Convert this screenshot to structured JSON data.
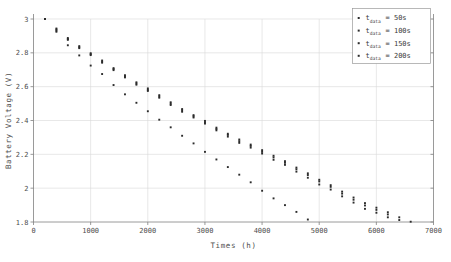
{
  "chart_data": {
    "type": "scatter",
    "title": "",
    "xlabel": "Times (h)",
    "ylabel": "Battery Voltage (V)",
    "xlim": [
      0,
      7000
    ],
    "ylim": [
      1.8,
      3.0
    ],
    "xticks": [
      0,
      1000,
      2000,
      3000,
      4000,
      5000,
      6000,
      7000
    ],
    "xticklabels": [
      "0",
      "1000",
      "2000",
      "3000",
      "4000",
      "5000",
      "6000",
      "7000"
    ],
    "yticks": [
      1.8,
      2.0,
      2.2,
      2.4,
      2.6,
      2.8,
      3.0
    ],
    "yticklabels": [
      "1.8",
      "2",
      "2.2",
      "2.4",
      "2.6",
      "2.8",
      "3"
    ],
    "grid": true,
    "legend_position": "top-right",
    "marker": "dot",
    "marker_color": "#2b2b2b",
    "series": [
      {
        "name": "t_data= 50s",
        "label_base": "t",
        "label_sub": "data",
        "label_value": "= 50s",
        "x": [
          200,
          400,
          600,
          800,
          1000,
          1200,
          1400,
          1600,
          1800,
          2000,
          2200,
          2400,
          2600,
          2800,
          3000,
          3200,
          3400,
          3600,
          3800,
          4000,
          4200,
          4400,
          4600,
          4800
        ],
        "y": [
          3.0,
          2.925,
          2.845,
          2.785,
          2.725,
          2.675,
          2.61,
          2.555,
          2.505,
          2.455,
          2.405,
          2.36,
          2.31,
          2.265,
          2.215,
          2.17,
          2.125,
          2.08,
          2.035,
          1.985,
          1.94,
          1.9,
          1.86,
          1.815
        ]
      },
      {
        "name": "t_data= 100s",
        "label_base": "t",
        "label_sub": "data",
        "label_value": "= 100s",
        "x": [
          200,
          400,
          600,
          800,
          1000,
          1200,
          1400,
          1600,
          1800,
          2000,
          2200,
          2400,
          2600,
          2800,
          3000,
          3200,
          3400,
          3600,
          3800,
          4000,
          4200,
          4400,
          4600,
          4800,
          5000,
          5200,
          5400,
          5600,
          5800,
          6000,
          6200,
          6400,
          6600
        ],
        "y": [
          3.0,
          2.932,
          2.877,
          2.828,
          2.787,
          2.742,
          2.698,
          2.655,
          2.612,
          2.575,
          2.535,
          2.492,
          2.452,
          2.418,
          2.382,
          2.342,
          2.305,
          2.268,
          2.24,
          2.205,
          2.168,
          2.138,
          2.098,
          2.062,
          2.022,
          1.992,
          1.952,
          1.915,
          1.878,
          1.855,
          1.828,
          1.812,
          1.802
        ]
      },
      {
        "name": "t_data= 150s",
        "label_base": "t",
        "label_sub": "data",
        "label_value": "= 150s",
        "x": [
          200,
          400,
          600,
          800,
          1000,
          1200,
          1400,
          1600,
          1800,
          2000,
          2200,
          2400,
          2600,
          2800,
          3000,
          3200,
          3400,
          3600,
          3800,
          4000,
          4200,
          4400,
          4600,
          4800,
          5000,
          5200,
          5400,
          5600,
          5800,
          6000,
          6200,
          6400
        ],
        "y": [
          3.0,
          2.938,
          2.882,
          2.833,
          2.792,
          2.748,
          2.704,
          2.661,
          2.619,
          2.582,
          2.542,
          2.5,
          2.46,
          2.425,
          2.39,
          2.35,
          2.315,
          2.278,
          2.25,
          2.215,
          2.182,
          2.15,
          2.112,
          2.078,
          2.04,
          2.008,
          1.968,
          1.932,
          1.898,
          1.872,
          1.845,
          1.828
        ]
      },
      {
        "name": "t_data= 200s",
        "label_base": "t",
        "label_sub": "data",
        "label_value": "= 200s",
        "x": [
          200,
          400,
          600,
          800,
          1000,
          1200,
          1400,
          1600,
          1800,
          2000,
          2200,
          2400,
          2600,
          2800,
          3000,
          3200,
          3400,
          3600,
          3800,
          4000,
          4200,
          4400,
          4600,
          4800,
          5000,
          5200,
          5400,
          5600,
          5800,
          6000,
          6200
        ],
        "y": [
          3.0,
          2.944,
          2.888,
          2.84,
          2.798,
          2.755,
          2.71,
          2.668,
          2.626,
          2.59,
          2.55,
          2.508,
          2.468,
          2.432,
          2.398,
          2.358,
          2.322,
          2.288,
          2.258,
          2.225,
          2.192,
          2.16,
          2.122,
          2.088,
          2.05,
          2.018,
          1.98,
          1.945,
          1.912,
          1.885,
          1.858
        ]
      }
    ]
  },
  "legend": {
    "entries": [
      {
        "base": "t",
        "sub": "data",
        "value": "= 50s"
      },
      {
        "base": "t",
        "sub": "data",
        "value": "= 100s"
      },
      {
        "base": "t",
        "sub": "data",
        "value": "= 150s"
      },
      {
        "base": "t",
        "sub": "data",
        "value": "= 200s"
      }
    ]
  }
}
